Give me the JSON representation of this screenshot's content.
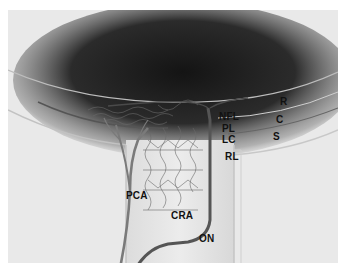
{
  "figure": {
    "background_color": "#e9e9e9",
    "vitreous_color": "#1c1c1c"
  },
  "labels": {
    "R": "R",
    "C": "C",
    "S": "S",
    "NFL": "NFL",
    "PL": "PL",
    "LC": "LC",
    "RL": "RL",
    "PCA": "PCA",
    "CRA": "CRA",
    "ON": "ON"
  }
}
